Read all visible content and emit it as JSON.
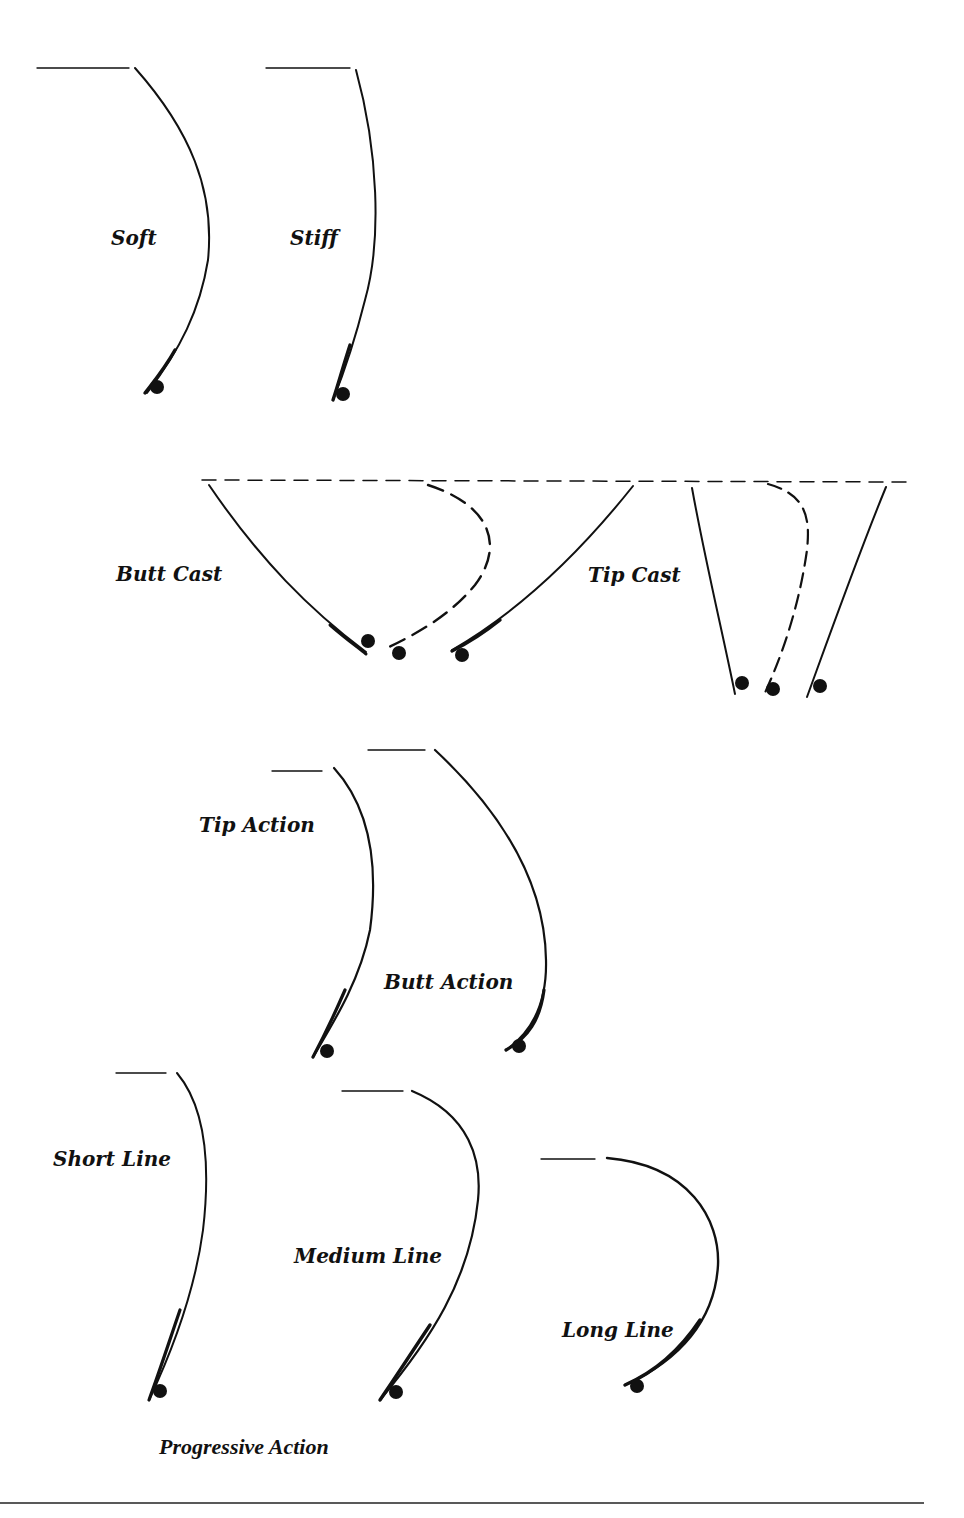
{
  "labels": {
    "soft": "Soft",
    "stiff": "Stiff",
    "butt_cast": "Butt Cast",
    "tip_cast": "Tip Cast",
    "tip_action": "Tip Action",
    "butt_action": "Butt Action",
    "short_line": "Short Line",
    "medium_line": "Medium Line",
    "long_line": "Long Line",
    "progressive_action": "Progressive Action"
  },
  "colors": {
    "ink": "#111111",
    "background": "#ffffff"
  }
}
